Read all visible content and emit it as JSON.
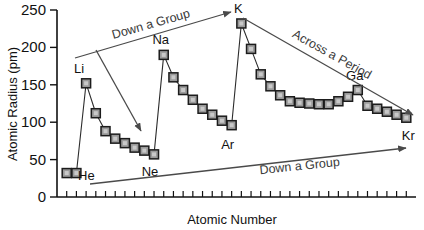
{
  "chart_data": {
    "type": "scatter",
    "title": "",
    "xlabel": "Atomic Number",
    "ylabel": "Atomic Radius (pm)",
    "xlim": [
      0,
      37
    ],
    "ylim": [
      0,
      250
    ],
    "grid": false,
    "legend": "none",
    "ytick_labels": [
      "0",
      "50",
      "100",
      "150",
      "200",
      "250"
    ],
    "ytick_values": [
      0,
      50,
      100,
      150,
      200,
      250
    ],
    "xtick_labels": [],
    "xtick_count": 36,
    "marker_shape": "square",
    "marker_fill": "#9a9a9a",
    "marker_edge": "#1c1c1c",
    "line_color": "#2b2b2b",
    "x": [
      1,
      2,
      3,
      4,
      5,
      6,
      7,
      8,
      9,
      10,
      11,
      12,
      13,
      14,
      15,
      16,
      17,
      18,
      19,
      20,
      21,
      22,
      23,
      24,
      25,
      26,
      27,
      28,
      29,
      30,
      31,
      32,
      33,
      34,
      35,
      36
    ],
    "values": [
      32,
      32,
      152,
      112,
      88,
      78,
      72,
      66,
      62,
      57,
      190,
      160,
      143,
      130,
      118,
      110,
      102,
      96,
      232,
      198,
      164,
      148,
      136,
      128,
      126,
      125,
      124,
      124,
      128,
      134,
      143,
      122,
      118,
      114,
      110,
      106
    ],
    "point_labels": [
      {
        "symbol": "He",
        "x": 2,
        "y": 32,
        "dx": 10,
        "dy": 7
      },
      {
        "symbol": "Li",
        "x": 3,
        "y": 152,
        "dx": -7,
        "dy": -10
      },
      {
        "symbol": "Ne",
        "x": 10,
        "y": 57,
        "dx": -4,
        "dy": 22
      },
      {
        "symbol": "Na",
        "x": 11,
        "y": 190,
        "dx": -3,
        "dy": -11
      },
      {
        "symbol": "Ar",
        "x": 18,
        "y": 96,
        "dx": -4,
        "dy": 24
      },
      {
        "symbol": "K",
        "x": 19,
        "y": 232,
        "dx": -3,
        "dy": -10
      },
      {
        "symbol": "Ga",
        "x": 31,
        "y": 143,
        "dx": -3,
        "dy": -10
      },
      {
        "symbol": "Kr",
        "x": 36,
        "y": 106,
        "dx": 2,
        "dy": 22
      }
    ],
    "annotations": [
      {
        "text": "Down a Group",
        "direction": "up",
        "x1": 75,
        "y1": 58,
        "x2": 231,
        "y2": 12,
        "tx": 152,
        "ty": 28,
        "rot": -16
      },
      {
        "text": "Across a Period",
        "direction": "down",
        "x1": 243,
        "y1": 18,
        "x2": 413,
        "y2": 115,
        "tx": 330,
        "ty": 58,
        "rot": 29
      },
      {
        "text": "Across a Period",
        "direction": "down",
        "x1": 96,
        "y1": 50,
        "x2": 141,
        "y2": 131,
        "tx": 0,
        "ty": 0,
        "rot": 0,
        "hide_text": true
      },
      {
        "text": "Down a Group",
        "direction": "up",
        "x1": 90,
        "y1": 184,
        "x2": 406,
        "y2": 148,
        "tx": 300,
        "ty": 170,
        "rot": -6
      }
    ]
  }
}
